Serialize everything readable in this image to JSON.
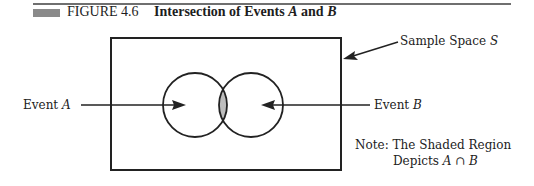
{
  "figure": {
    "number": "FIGURE 4.6",
    "title_prefix": "Intersection of Events ",
    "title_var_a": "A",
    "title_and": " and ",
    "title_var_b": "B"
  },
  "labels": {
    "event_a_prefix": "Event ",
    "event_a_var": "A",
    "event_b_prefix": "Event ",
    "event_b_var": "B",
    "sample_space_prefix": "Sample Space ",
    "sample_space_var": "S"
  },
  "note": {
    "line1": "Note: The Shaded Region",
    "line2_prefix": "Depicts ",
    "line2_expr": "A ∩ B"
  },
  "colors": {
    "ink": "#222222",
    "shaded_region": "#bdbdbd",
    "caption_bar": "#8a8a8a",
    "rule": "#6f6f6f"
  },
  "geometry": {
    "sample_space_rect": {
      "x": 111,
      "y": 38,
      "w": 230,
      "h": 132
    },
    "circle_a": {
      "cx": 195,
      "cy": 105,
      "r": 32
    },
    "circle_b": {
      "cx": 251,
      "cy": 105,
      "r": 32
    }
  }
}
